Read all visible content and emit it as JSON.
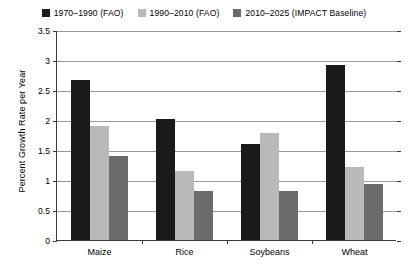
{
  "chart_data": {
    "type": "bar",
    "title": "",
    "xlabel": "",
    "ylabel": "Percent Growth Rate per Year",
    "categories": [
      "Maize",
      "Rice",
      "Soybeans",
      "Wheat"
    ],
    "series": [
      {
        "name": "1970–1990 (FAO)",
        "color": "#1a1a1a",
        "values": [
          2.67,
          2.02,
          1.6,
          2.92
        ]
      },
      {
        "name": "1990–2010 (FAO)",
        "color": "#b9b9b9",
        "values": [
          1.9,
          1.15,
          1.78,
          1.22
        ]
      },
      {
        "name": "2010–2025 (IMPACT Baseline)",
        "color": "#6b6b6b",
        "values": [
          1.4,
          0.82,
          0.82,
          0.93
        ]
      }
    ],
    "ylim": [
      0,
      3.5
    ],
    "yticks": [
      0,
      0.5,
      1,
      1.5,
      2,
      2.5,
      3,
      3.5
    ],
    "ytick_labels": [
      "0",
      "0.5",
      "1",
      "1.5",
      "2",
      "2.5",
      "3",
      "3.5"
    ],
    "grid": true,
    "legend_position": "top-center"
  },
  "legend": {
    "items": [
      {
        "label": "1970–1990 (FAO)"
      },
      {
        "label": "1990–2010 (FAO)"
      },
      {
        "label": "2010–2025 (IMPACT Baseline)"
      }
    ]
  },
  "axes": {
    "y_title": "Percent Growth Rate per Year"
  }
}
